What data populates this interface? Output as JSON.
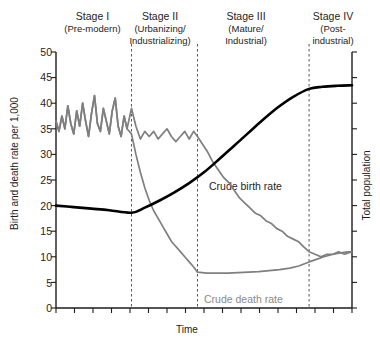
{
  "chart_data": {
    "type": "line",
    "title": "",
    "xlabel": "Time",
    "ylabel": "Birth and death rate per 1,000",
    "y2label": "Total population",
    "ylim": [
      0,
      50
    ],
    "ytick_labels": [
      "50",
      "45",
      "40",
      "35",
      "30",
      "25",
      "20",
      "15",
      "10",
      "5",
      "0"
    ],
    "ytick_values": [
      50,
      45,
      40,
      35,
      30,
      25,
      20,
      15,
      10,
      5,
      0
    ],
    "xtick_labels": [],
    "grid": false,
    "legend_position": "inline-annotations",
    "stage_boundaries_x_fraction": [
      0.255,
      0.478,
      0.855
    ],
    "annotations": [
      {
        "name": "crude-birth-rate",
        "text": "Crude birth rate",
        "color": "#1d1d1d"
      },
      {
        "name": "crude-death-rate",
        "text": "Crude death rate",
        "color": "#8a8a8a"
      }
    ],
    "series": [
      {
        "name": "Crude birth rate",
        "color": "#7f7f7f",
        "x": [
          0.0,
          0.01,
          0.02,
          0.03,
          0.04,
          0.05,
          0.06,
          0.07,
          0.08,
          0.09,
          0.1,
          0.11,
          0.12,
          0.13,
          0.14,
          0.15,
          0.16,
          0.17,
          0.18,
          0.19,
          0.2,
          0.21,
          0.22,
          0.23,
          0.24,
          0.255,
          0.27,
          0.285,
          0.3,
          0.315,
          0.33,
          0.345,
          0.36,
          0.375,
          0.39,
          0.405,
          0.42,
          0.435,
          0.45,
          0.465,
          0.478,
          0.495,
          0.512,
          0.53,
          0.548,
          0.566,
          0.584,
          0.602,
          0.62,
          0.638,
          0.656,
          0.674,
          0.692,
          0.71,
          0.728,
          0.746,
          0.764,
          0.782,
          0.8,
          0.818,
          0.836,
          0.855,
          0.875,
          0.895,
          0.915,
          0.935,
          0.955,
          0.975,
          1.0
        ],
        "values": [
          36.5,
          34.5,
          37.5,
          35.0,
          39.5,
          36.0,
          34.0,
          38.5,
          35.5,
          40.0,
          36.5,
          33.5,
          38.0,
          41.5,
          36.0,
          34.5,
          39.0,
          36.5,
          34.0,
          38.5,
          41.0,
          35.5,
          33.5,
          37.5,
          35.0,
          39.0,
          35.5,
          33.0,
          34.5,
          33.5,
          34.5,
          33.0,
          34.0,
          35.0,
          33.5,
          32.5,
          33.5,
          34.5,
          33.0,
          34.5,
          33.5,
          32.0,
          30.5,
          28.5,
          27.0,
          25.5,
          24.5,
          23.0,
          21.5,
          20.5,
          19.5,
          18.5,
          18.0,
          17.0,
          16.5,
          15.5,
          15.0,
          14.0,
          13.5,
          13.0,
          12.0,
          11.0,
          10.5,
          10.0,
          10.5,
          10.5,
          11.0,
          10.5,
          11.0
        ]
      },
      {
        "name": "Crude death rate",
        "color": "#7f7f7f",
        "x": [
          0.0,
          0.01,
          0.02,
          0.03,
          0.04,
          0.05,
          0.06,
          0.07,
          0.08,
          0.09,
          0.1,
          0.11,
          0.12,
          0.13,
          0.14,
          0.15,
          0.16,
          0.17,
          0.18,
          0.19,
          0.2,
          0.21,
          0.22,
          0.23,
          0.24,
          0.255,
          0.27,
          0.285,
          0.3,
          0.315,
          0.33,
          0.345,
          0.36,
          0.375,
          0.39,
          0.405,
          0.42,
          0.435,
          0.45,
          0.465,
          0.478,
          0.51,
          0.545,
          0.58,
          0.615,
          0.65,
          0.685,
          0.72,
          0.755,
          0.79,
          0.82,
          0.855,
          0.88,
          0.905,
          0.93,
          0.955,
          0.978,
          1.0
        ],
        "values": [
          36.5,
          34.5,
          37.5,
          35.0,
          39.5,
          36.0,
          34.0,
          38.5,
          35.5,
          40.0,
          36.5,
          33.5,
          38.0,
          41.5,
          36.0,
          34.5,
          39.0,
          36.5,
          34.0,
          38.5,
          41.0,
          35.5,
          33.5,
          37.5,
          35.0,
          34.0,
          30.0,
          26.5,
          23.5,
          21.0,
          19.0,
          17.5,
          16.0,
          14.5,
          13.0,
          12.0,
          11.0,
          10.0,
          9.0,
          8.0,
          7.0,
          6.8,
          6.8,
          6.8,
          6.9,
          7.0,
          7.1,
          7.3,
          7.5,
          7.8,
          8.2,
          9.0,
          9.5,
          10.0,
          10.4,
          10.7,
          10.9,
          11.0
        ]
      },
      {
        "name": "Total population",
        "color": "#000000",
        "x": [
          0.0,
          0.06,
          0.12,
          0.18,
          0.255,
          0.3,
          0.35,
          0.4,
          0.45,
          0.5,
          0.55,
          0.6,
          0.65,
          0.7,
          0.75,
          0.8,
          0.855,
          0.9,
          0.95,
          1.0
        ],
        "values": [
          20.0,
          19.7,
          19.4,
          19.1,
          18.6,
          19.6,
          21.0,
          22.6,
          24.4,
          26.5,
          29.0,
          31.6,
          34.2,
          36.8,
          39.2,
          41.2,
          42.8,
          43.2,
          43.4,
          43.5
        ]
      }
    ]
  },
  "stages": [
    {
      "id": "stage-1",
      "title": "Stage I",
      "sub": [
        "(Pre-modern)"
      ]
    },
    {
      "id": "stage-2",
      "title": "Stage II",
      "sub": [
        "(Urbanizing/",
        "Industrializing)"
      ]
    },
    {
      "id": "stage-3",
      "title": "Stage III",
      "sub": [
        "(Mature/",
        "Industrial)"
      ]
    },
    {
      "id": "stage-4",
      "title": "Stage IV",
      "sub": [
        "(Post-",
        "industrial)"
      ]
    }
  ],
  "stage_text": {
    "s1_title": "Stage I",
    "s1_l1": "(Pre-modern)",
    "s1_l2": "",
    "s2_title": "Stage II",
    "s2_l1": "(Urbanizing/",
    "s2_l2": "Industrializing)",
    "s3_title": "Stage III",
    "s3_l1": "(Mature/",
    "s3_l2": "Industrial)",
    "s4_title": "Stage IV",
    "s4_l1": "(Post-",
    "s4_l2": "industrial)"
  },
  "axes": {
    "y_title": "Birth and death rate per 1,000",
    "y2_title": "Total population",
    "x_title": "Time",
    "y_ticks": {
      "t50": "50",
      "t45": "45",
      "t40": "40",
      "t35": "35",
      "t30": "30",
      "t25": "25",
      "t20": "20",
      "t15": "15",
      "t10": "10",
      "t5": "5",
      "t0": "0"
    }
  },
  "labels": {
    "birth": "Crude birth rate",
    "death": "Crude death rate"
  },
  "colors": {
    "axis": "#1d1d1d",
    "population_line": "#000000",
    "rate_line": "#7f7f7f",
    "death_label": "#8a8a8a",
    "divider": "#555555",
    "background": "#ffffff"
  }
}
